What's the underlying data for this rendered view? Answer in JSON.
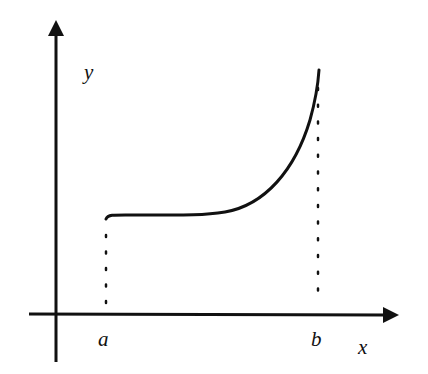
{
  "diagram": {
    "type": "function-graph",
    "axes": {
      "x_label": "x",
      "y_label": "y"
    },
    "markers": [
      {
        "label": "a",
        "x_px": 106
      },
      {
        "label": "b",
        "x_px": 318
      }
    ],
    "curve_description": "nearly flat from a, then increasing steeply toward b",
    "colors": {
      "ink": "#111111",
      "background": "#ffffff"
    }
  }
}
